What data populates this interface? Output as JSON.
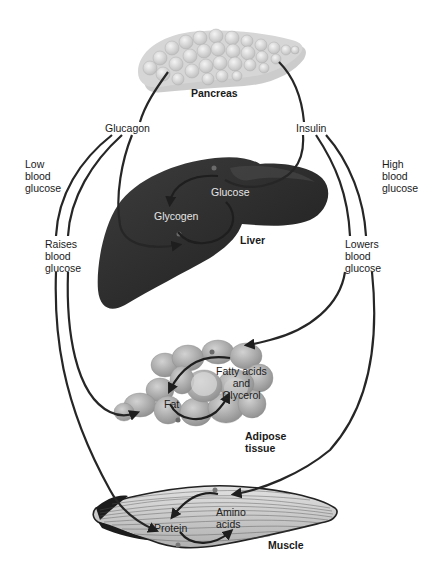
{
  "diagram": {
    "organs": {
      "pancreas": "Pancreas",
      "liver": "Liver",
      "adipose": "Adipose\ntissue",
      "muscle": "Muscle"
    },
    "hormones": {
      "glucagon": "Glucagon",
      "insulin": "Insulin"
    },
    "conditions": {
      "low": "Low\nblood\nglucose",
      "high": "High\nblood\nglucose"
    },
    "effects": {
      "raises": "Raises\nblood\nglucose",
      "lowers": "Lowers\nblood\nglucose"
    },
    "molecules": {
      "glucose": "Glucose",
      "glycogen": "Glycogen",
      "fat": "Fat",
      "fatty_acids": "Fatty acids\nand\nGlycerol",
      "protein": "Protein",
      "amino_acids": "Amino\nacids"
    },
    "colors": {
      "line": "#2a2a2a",
      "liver": "#333333",
      "pancreas": "#d8d8d8",
      "adipose": "#b5b5b5",
      "muscle": "#cfcfcf"
    }
  }
}
